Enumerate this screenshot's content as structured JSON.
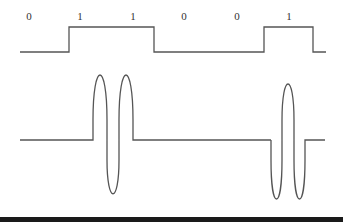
{
  "diagram": {
    "type": "digital-to-analog-modulation",
    "bits": [
      "0",
      "1",
      "1",
      "0",
      "0",
      "1"
    ],
    "bit_label_positions": [
      29,
      80,
      133,
      184,
      237,
      289
    ],
    "colors": {
      "line": "#555555",
      "text": "#333333",
      "bottom_rule": "#1a1a1a"
    },
    "digital_signal": {
      "low_y": 52,
      "high_y": 27,
      "points": [
        [
          20,
          52
        ],
        [
          69,
          52
        ],
        [
          69,
          27
        ],
        [
          154,
          27
        ],
        [
          154,
          52
        ],
        [
          264,
          52
        ],
        [
          264,
          27
        ],
        [
          313,
          27
        ],
        [
          313,
          52
        ],
        [
          326,
          52
        ]
      ]
    },
    "modulated_signal": {
      "baseline_y": 140,
      "pulses": [
        {
          "name": "positive-burst",
          "start_x": 93,
          "end_x": 133,
          "peak_y": 77,
          "trough_y": 190
        },
        {
          "name": "negative-burst",
          "start_x": 271,
          "end_x": 305,
          "peak_y": 88,
          "trough_y": 200
        }
      ]
    }
  }
}
